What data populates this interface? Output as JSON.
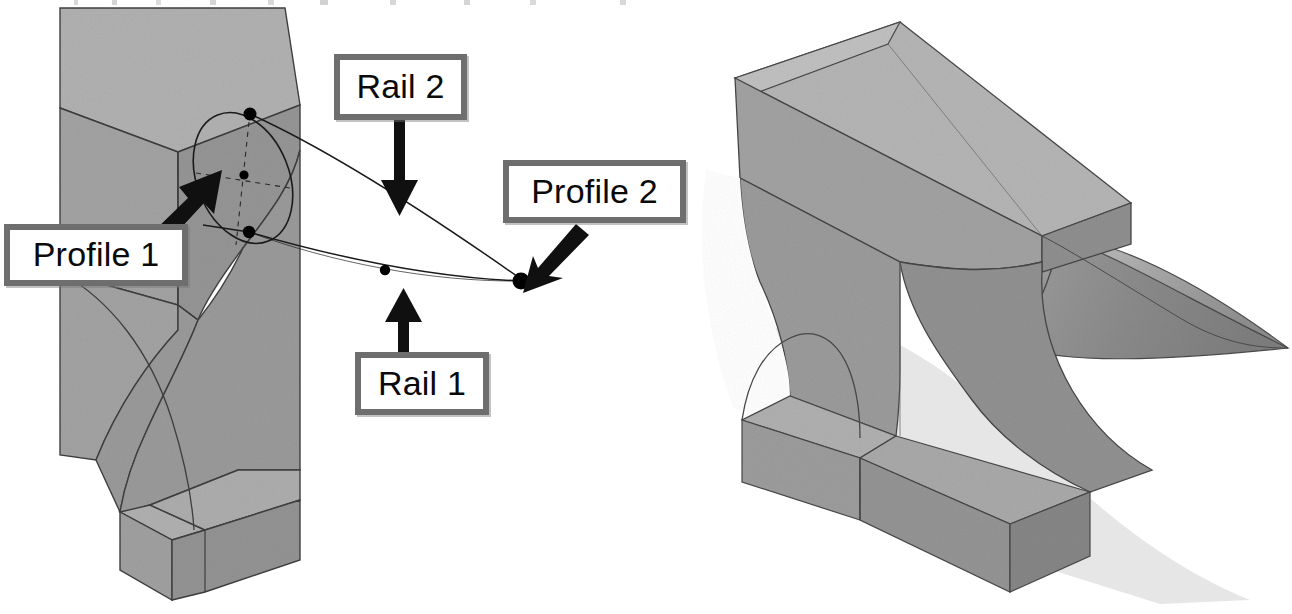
{
  "figure": {
    "background_color": "#ffffff",
    "callout_border_color": "#6e6e6e",
    "callout_fill_color": "#ffffff",
    "callout_text_color": "#0a0a0a",
    "leader_color": "#111111",
    "solid_light_color": "#b4b4b4",
    "solid_mid_color": "#9b9b9b",
    "solid_dark_color": "#8a8a8a",
    "solid_edge_color": "#3c3c3c",
    "curve_color": "#1a1a1a",
    "point_color": "#000000",
    "shadow_color": "#dcdcdc"
  },
  "callouts": [
    {
      "id": "profile1",
      "label": "Profile 1",
      "points_to": "elliptical-profile-sketch-on-left-solid",
      "arrow_direction": "up-right"
    },
    {
      "id": "rail2",
      "label": "Rail 2",
      "points_to": "upper-guide-curve",
      "arrow_direction": "down"
    },
    {
      "id": "profile2",
      "label": "Profile 2",
      "points_to": "converged-end-point",
      "arrow_direction": "down-left"
    },
    {
      "id": "rail1",
      "label": "Rail 1",
      "points_to": "lower-guide-curve",
      "arrow_direction": "up"
    }
  ],
  "views": [
    {
      "id": "left-view",
      "name": "profiles-and-rails-definition",
      "description": "Half block with concave swept face showing the sketch geometry"
    },
    {
      "id": "right-view",
      "name": "completed-anvil-solid",
      "description": "Finished anvil body with horn and waisted base"
    }
  ],
  "geometry": {
    "profile1_control_points": 3,
    "rail_count": 2,
    "profile_count": 2,
    "rail1_control_points": 3,
    "rail2_control_points": 2
  }
}
